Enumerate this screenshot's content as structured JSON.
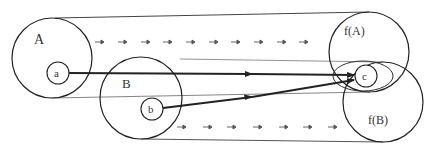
{
  "diagram": {
    "colors": {
      "stroke": "#222222",
      "thin": "#555555",
      "arrow_dim": "#666666",
      "background": "#ffffff"
    },
    "sets": [
      {
        "id": "A",
        "label": "A",
        "cx": 52,
        "cy": 58,
        "r": 40
      },
      {
        "id": "B",
        "label": "B",
        "cx": 141,
        "cy": 98,
        "r": 41
      },
      {
        "id": "fA",
        "label": "f(A)",
        "cx": 369,
        "cy": 52,
        "r": 40
      },
      {
        "id": "fB",
        "label": "f(B)",
        "cx": 383,
        "cy": 102,
        "r": 40
      }
    ],
    "elements": [
      {
        "id": "a",
        "label": "a",
        "cx": 58,
        "cy": 73,
        "r": 10
      },
      {
        "id": "b",
        "label": "b",
        "cx": 152,
        "cy": 109,
        "r": 11
      },
      {
        "id": "c",
        "label": "c",
        "cx": 366,
        "cy": 76,
        "r": 11
      }
    ],
    "mappings": [
      {
        "from": "a",
        "to": "c",
        "label": "a ↦ c"
      },
      {
        "from": "b",
        "to": "c",
        "label": "b ↦ c"
      }
    ],
    "flow_arrows": {
      "top_row": {
        "y": 42,
        "x_positions": [
          98,
          121,
          144,
          166,
          189,
          212,
          234,
          257,
          280,
          302
        ]
      },
      "bottom_row": {
        "y": 127,
        "x_positions": [
          180,
          206,
          230,
          256,
          282,
          306,
          331
        ]
      }
    }
  }
}
